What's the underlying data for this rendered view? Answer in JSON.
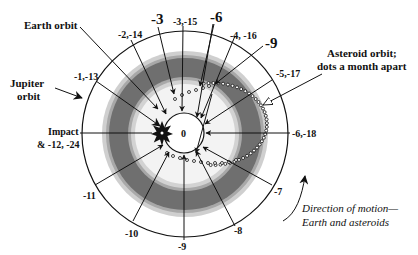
{
  "diagram": {
    "center_label": "0",
    "labels": {
      "earth_orbit": "Earth orbit",
      "jupiter_orbit_line1": "Jupiter",
      "jupiter_orbit_line2": "orbit",
      "impact_line1": "Impact",
      "impact_line2": "& -12, -24",
      "asteroid_line1": "Asteroid orbit;",
      "asteroid_line2": "dots a month apart",
      "direction_line1": "Direction of motion—",
      "direction_line2": "Earth and asteroids"
    },
    "month_markers": [
      {
        "id": "m1",
        "label": "-1,-13"
      },
      {
        "id": "m2",
        "label": "-2,-14"
      },
      {
        "id": "m3big",
        "label": "-3"
      },
      {
        "id": "m3",
        "label": "-3,-15"
      },
      {
        "id": "m6big",
        "label": "-6"
      },
      {
        "id": "m4",
        "label": "-4, -16"
      },
      {
        "id": "m9big",
        "label": "-9"
      },
      {
        "id": "m5",
        "label": "-5,-17"
      },
      {
        "id": "m6",
        "label": "-6,-18"
      },
      {
        "id": "m7",
        "label": "-7"
      },
      {
        "id": "m8",
        "label": "-8"
      },
      {
        "id": "m9",
        "label": "-9"
      },
      {
        "id": "m10",
        "label": "-10"
      },
      {
        "id": "m11",
        "label": "-11"
      }
    ],
    "colors": {
      "band_light": "#c8c8c8",
      "band_mid": "#a9a9a9",
      "band_dark": "#6e6e6e",
      "inner_disk": "#f2f2f2",
      "ink": "#111111"
    }
  }
}
